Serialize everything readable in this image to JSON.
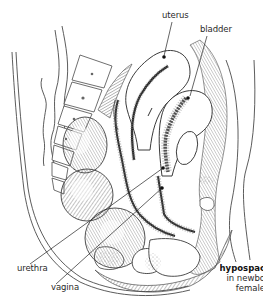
{
  "figure": {
    "type": "anatomical-illustration",
    "line_color": "#3a3a3a",
    "shade_color": "#6a6a6a",
    "dark_lining_color": "#2a2a2a",
    "background": "#ffffff"
  },
  "labels": {
    "uterus": "uterus",
    "bladder": "bladder",
    "urethra": "urethra",
    "vagina": "vagina"
  },
  "caption": {
    "title": "hypospac",
    "line2": "in newbo",
    "line3": "female"
  }
}
